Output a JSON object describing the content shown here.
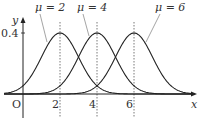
{
  "chart_data": {
    "type": "line",
    "title": "",
    "xlabel": "x",
    "ylabel": "y",
    "origin_label": "O",
    "x_ticks": [
      "2",
      "4",
      "6"
    ],
    "y_ticks": [
      "0.4"
    ],
    "xlim": [
      -1.3,
      8.4
    ],
    "ylim": [
      0,
      0.5
    ],
    "grid": false,
    "series": [
      {
        "name": "μ = 2",
        "mu": 2,
        "sigma": 1,
        "peak": 0.4
      },
      {
        "name": "μ = 4",
        "mu": 4,
        "sigma": 1,
        "peak": 0.4
      },
      {
        "name": "μ = 6",
        "mu": 6,
        "sigma": 1,
        "peak": 0.4
      }
    ],
    "reference_lines": [
      {
        "x": 2,
        "style": "dotted"
      },
      {
        "x": 4,
        "style": "dotted"
      },
      {
        "x": 6,
        "style": "dotted"
      }
    ]
  },
  "labels": {
    "mu2": "μ = 2",
    "mu4": "μ = 4",
    "mu6": "μ = 6",
    "y_axis": "y",
    "x_axis": "x",
    "origin": "O",
    "tick_x_2": "2",
    "tick_x_4": "4",
    "tick_x_6": "6",
    "tick_y_04": "0.4"
  }
}
